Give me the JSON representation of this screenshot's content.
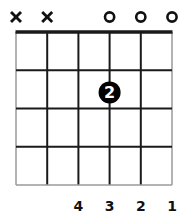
{
  "chord_diagram": {
    "strings": 6,
    "frets_shown": 4,
    "string_markers": [
      "x",
      "x",
      "",
      "o",
      "o",
      "o"
    ],
    "fingered_notes": [
      {
        "string": 3,
        "fret": 2,
        "finger": "2"
      }
    ],
    "bottom_labels": [
      "",
      "",
      "4",
      "3",
      "2",
      "1"
    ],
    "colors": {
      "line": "#1a1a1a",
      "outer_line": "#9a9a9a",
      "dot": "#000000",
      "dot_text": "#ffffff",
      "text": "#111111"
    }
  }
}
